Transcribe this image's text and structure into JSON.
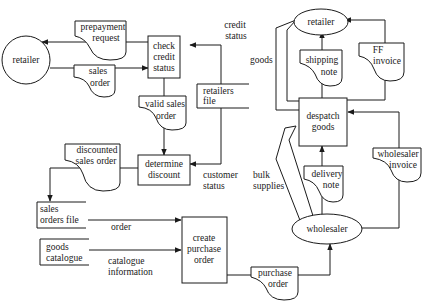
{
  "diagram": {
    "entities": {
      "retailer_left": "retailer",
      "retailer_right": "retailer",
      "wholesaler": "wholesaler"
    },
    "processes": {
      "check_credit": [
        "check",
        "credit",
        "status"
      ],
      "determine_discount": [
        "determine",
        "discount"
      ],
      "create_purchase_order": [
        "create",
        "purchase",
        "order"
      ],
      "despatch_goods": [
        "despatch",
        "goods"
      ]
    },
    "stores": {
      "retailers_file": [
        "retailers",
        "file"
      ],
      "sales_orders_file": [
        "sales",
        "orders file"
      ],
      "goods_catalogue": [
        "goods",
        "catalogue"
      ]
    },
    "documents": {
      "prepayment_request": [
        "prepayment",
        "request"
      ],
      "sales_order": [
        "sales",
        "order"
      ],
      "valid_sales_order": [
        "valid sales",
        "order"
      ],
      "discounted_sales_order": [
        "discounted",
        "sales order"
      ],
      "purchase_order": [
        "purchase",
        "order"
      ],
      "shipping_note": [
        "shipping",
        "note"
      ],
      "ff_invoice": [
        "FF",
        "invoice"
      ],
      "delivery_note": [
        "delivery",
        "note"
      ],
      "wholesaler_invoice": [
        "wholesaler",
        "invoice"
      ]
    },
    "flow_labels": {
      "credit_status": [
        "credit",
        "status"
      ],
      "customer_status": [
        "customer",
        "status"
      ],
      "order": "order",
      "catalogue_information": [
        "catalogue",
        "information"
      ],
      "goods": "goods",
      "bulk_supplies": [
        "bulk",
        "supplies"
      ]
    }
  }
}
